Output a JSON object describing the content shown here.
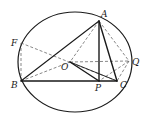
{
  "diagram": {
    "type": "geometry-circle",
    "circle": {
      "cx": 75,
      "cy": 62,
      "rx": 57,
      "ry": 50,
      "stroke": "#1a1a1a"
    },
    "points": {
      "A": {
        "x": 99,
        "y": 21,
        "label": "A",
        "lx": 101,
        "ly": 17
      },
      "B": {
        "x": 21,
        "y": 81,
        "label": "B",
        "lx": 11,
        "ly": 88
      },
      "C": {
        "x": 117,
        "y": 81,
        "label": "C",
        "lx": 120,
        "ly": 88
      },
      "O": {
        "x": 70,
        "y": 62,
        "label": "O",
        "lx": 61,
        "ly": 70
      },
      "P": {
        "x": 99,
        "y": 81,
        "label": "P",
        "lx": 95,
        "ly": 91
      },
      "Q": {
        "x": 129,
        "y": 61,
        "label": "Q",
        "lx": 132,
        "ly": 65
      },
      "F": {
        "x": 21,
        "y": 43,
        "label": "F",
        "lx": 11,
        "ly": 46
      }
    },
    "solid_segments": [
      [
        "A",
        "B"
      ],
      [
        "A",
        "P"
      ],
      [
        "A",
        "C"
      ],
      [
        "B",
        "C"
      ],
      [
        "O",
        "P"
      ],
      [
        "O",
        "C"
      ]
    ],
    "dashed_segments": [
      [
        "F",
        "B"
      ],
      [
        "F",
        "O"
      ],
      [
        "O",
        "Q"
      ],
      [
        "A",
        "O"
      ],
      [
        "B",
        "O"
      ],
      [
        "A",
        "Q"
      ],
      [
        "Q",
        "C"
      ],
      [
        "Q",
        "P"
      ]
    ],
    "labels": [
      "A",
      "B",
      "C",
      "O",
      "P",
      "Q",
      "F"
    ]
  }
}
